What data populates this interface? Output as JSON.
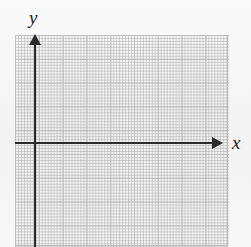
{
  "figure": {
    "type": "coordinate-plane",
    "background_color": "#f5f5f5",
    "axis_color": "#2b2b2b",
    "major_gridline_color": "#bdbdbd",
    "minor_gridline_color": "#969696"
  },
  "axes": {
    "x": {
      "label": "x",
      "arrow_direction": "right"
    },
    "y": {
      "label": "y",
      "arrow_direction": "up"
    }
  },
  "grid": {
    "major_cell_px": 23.8,
    "minor_cell_px": 11.9,
    "columns": 9,
    "rows": 9,
    "tick_labels": [],
    "origin": {
      "x_px": 35,
      "y_px": 143
    }
  },
  "chart_data": {
    "type": "scatter",
    "title": "",
    "xlabel": "x",
    "ylabel": "y",
    "x": [],
    "values": [],
    "series": [],
    "xlim": [
      -1,
      8
    ],
    "ylim": [
      -5,
      4
    ],
    "grid": true,
    "legend": "none",
    "annotations": []
  }
}
